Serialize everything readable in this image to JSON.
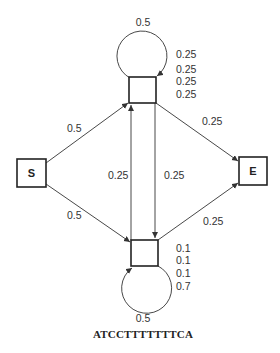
{
  "diagram": {
    "type": "hidden-markov-model-state-diagram",
    "nodes": {
      "start": {
        "label": "S"
      },
      "end": {
        "label": "E"
      },
      "top_state": {
        "self_loop_prob": "0.5",
        "emissions": [
          "0.25",
          "0.25",
          "0.25",
          "0.25"
        ]
      },
      "bottom_state": {
        "self_loop_prob": "0.5",
        "emissions": [
          "0.1",
          "0.1",
          "0.1",
          "0.7"
        ]
      }
    },
    "edges": {
      "start_to_top": "0.5",
      "start_to_bottom": "0.5",
      "top_to_end": "0.25",
      "bottom_to_end": "0.25",
      "bottom_to_top": "0.25",
      "top_to_bottom": "0.25"
    },
    "sequence": "ATCCTTTTTTTCA"
  }
}
